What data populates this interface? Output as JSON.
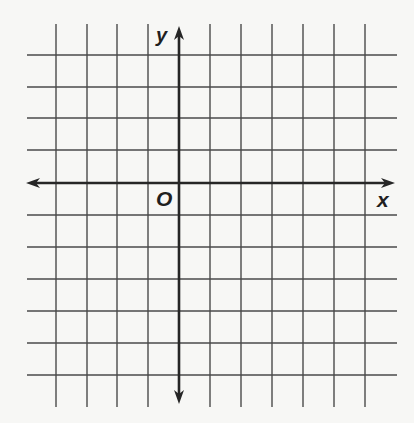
{
  "diagram": {
    "type": "coordinate-plane",
    "labels": {
      "y_axis": "y",
      "x_axis": "x",
      "origin": "O"
    },
    "grid": {
      "vertical_lines_x": [
        56,
        87,
        117,
        148,
        210,
        241,
        272,
        303,
        334,
        365
      ],
      "horizontal_lines_y": [
        55,
        87,
        118,
        150,
        215,
        247,
        279,
        311,
        343,
        375
      ],
      "vertical_span": [
        24,
        407
      ],
      "horizontal_span": [
        27,
        397
      ],
      "squares_left_of_y_axis": 5,
      "squares_right_of_y_axis": 6,
      "squares_above_x_axis": 5,
      "squares_below_x_axis": 6
    },
    "axes": {
      "x_axis": {
        "y": 183,
        "from": 26,
        "to": 395,
        "arrows": "both"
      },
      "y_axis": {
        "x": 179,
        "from": 26,
        "to": 404,
        "arrows": "both"
      }
    },
    "colors": {
      "background": "#f7f7f5",
      "grid_line": "#4a4a4a",
      "axis_line": "#262626"
    }
  }
}
